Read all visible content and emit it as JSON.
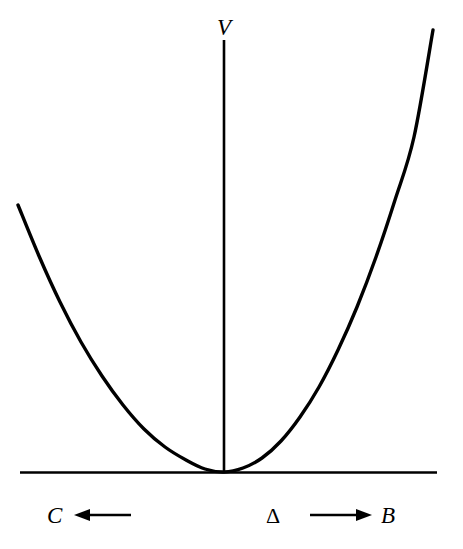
{
  "figure": {
    "background_color": "#ffffff",
    "stroke_color": "#000000",
    "width": 463,
    "height": 549
  },
  "labels": {
    "v_axis": "V",
    "c_branch": "C",
    "b_branch": "B",
    "order_parameter": "Δ"
  },
  "icons": {
    "left_arrow": "arrow-left-icon",
    "right_arrow": "arrow-right-icon"
  },
  "chart_data": {
    "type": "line",
    "title": "",
    "xlabel": "Δ",
    "ylabel": "V",
    "grid": false,
    "legend": null,
    "axes": {
      "vertical_axis": {
        "label": "V",
        "x_px": 224,
        "y_top_px": 40,
        "y_bottom_px": 472
      },
      "horizontal_axis": {
        "label": "Δ",
        "y_px": 472,
        "x_left_px": 20,
        "x_right_px": 437
      },
      "origin_px": {
        "x": 224,
        "y": 472
      }
    },
    "curve": {
      "name": "V(Δ)",
      "shape": "parabola",
      "vertex_px": {
        "x": 224,
        "y": 472
      },
      "left_endpoint_px": {
        "x": 18,
        "y": 205
      },
      "right_endpoint_px": {
        "x": 433,
        "y": 30
      },
      "left_curvature": 0.00623,
      "right_curvature": 0.01021,
      "stroke_width_px": 3.4,
      "points_px": [
        [
          18,
          205
        ],
        [
          39,
          256
        ],
        [
          60,
          302
        ],
        [
          81,
          342
        ],
        [
          102,
          376
        ],
        [
          123,
          405
        ],
        [
          144,
          429
        ],
        [
          165,
          447
        ],
        [
          186,
          460
        ],
        [
          205,
          469
        ],
        [
          224,
          472
        ],
        [
          243,
          468
        ],
        [
          262,
          458
        ],
        [
          281,
          441
        ],
        [
          300,
          417
        ],
        [
          319,
          387
        ],
        [
          338,
          350
        ],
        [
          357,
          307
        ],
        [
          376,
          257
        ],
        [
          395,
          200
        ],
        [
          414,
          137
        ],
        [
          433,
          30
        ]
      ]
    },
    "annotations": [
      {
        "name": "left-branch",
        "label": "C",
        "arrow": "left",
        "label_px": {
          "x": 47,
          "y": 504
        },
        "arrow_from_px": {
          "x": 131,
          "y": 515
        },
        "arrow_to_px": {
          "x": 74,
          "y": 515
        }
      },
      {
        "name": "order-parameter",
        "label": "Δ",
        "label_px": {
          "x": 266,
          "y": 505
        }
      },
      {
        "name": "right-branch",
        "label": "B",
        "arrow": "right",
        "label_px": {
          "x": 381,
          "y": 504
        },
        "arrow_from_px": {
          "x": 310,
          "y": 515
        },
        "arrow_to_px": {
          "x": 372,
          "y": 515
        }
      }
    ]
  }
}
